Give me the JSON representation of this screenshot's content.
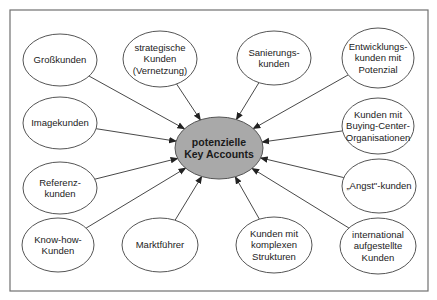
{
  "frame": {
    "x": 10,
    "y": 10,
    "width": 418,
    "height": 281,
    "stroke": "#707070"
  },
  "colors": {
    "center_fill": "#a9a9a9",
    "stroke": "#555555",
    "arrow": "#333333",
    "node_fill": "#ffffff"
  },
  "center": {
    "id": "potenzielle-key-accounts",
    "lines": [
      "potenzielle",
      "Key Accounts"
    ],
    "cx": 219,
    "cy": 148,
    "rx": 44,
    "ry": 31
  },
  "nodes": [
    {
      "id": "grosskunden",
      "lines": [
        "Großkunden"
      ],
      "cx": 60,
      "cy": 60,
      "rx": 37,
      "ry": 26
    },
    {
      "id": "strategische-kunden",
      "lines": [
        "strategische",
        "Kunden",
        "(Vernetzung)"
      ],
      "cx": 160,
      "cy": 59,
      "rx": 37,
      "ry": 28
    },
    {
      "id": "sanierungskunden",
      "lines": [
        "Sanierungs-",
        "kunden"
      ],
      "cx": 274,
      "cy": 58,
      "rx": 37,
      "ry": 27
    },
    {
      "id": "entwicklungskunden",
      "lines": [
        "Entwicklungs-",
        "kunden mit",
        "Potenzial"
      ],
      "cx": 378,
      "cy": 58,
      "rx": 36,
      "ry": 30
    },
    {
      "id": "imagekunden",
      "lines": [
        "Imagekunden"
      ],
      "cx": 60,
      "cy": 123,
      "rx": 37,
      "ry": 26
    },
    {
      "id": "buying-center-kunden",
      "lines": [
        "Kunden mit",
        "Buying-Center-",
        "Organisationen"
      ],
      "cx": 378,
      "cy": 126,
      "rx": 36,
      "ry": 28
    },
    {
      "id": "referenzkunden",
      "lines": [
        "Referenz-",
        "kunden"
      ],
      "cx": 60,
      "cy": 188,
      "rx": 37,
      "ry": 26
    },
    {
      "id": "angst-kunden",
      "lines": [
        "„Angst\"-kunden"
      ],
      "cx": 379,
      "cy": 186,
      "rx": 37,
      "ry": 27
    },
    {
      "id": "know-how-kunden",
      "lines": [
        "Know-how-",
        "Kunden"
      ],
      "cx": 58,
      "cy": 245,
      "rx": 36,
      "ry": 27
    },
    {
      "id": "marktfuehrer",
      "lines": [
        "Marktführer"
      ],
      "cx": 160,
      "cy": 245,
      "rx": 38,
      "ry": 27
    },
    {
      "id": "komplexe-strukturen",
      "lines": [
        "Kunden mit",
        "komplexen",
        "Strukturen"
      ],
      "cx": 274,
      "cy": 245,
      "rx": 38,
      "ry": 28
    },
    {
      "id": "international-kunden",
      "lines": [
        "international",
        "aufgestellte",
        "Kunden"
      ],
      "cx": 378,
      "cy": 246,
      "rx": 38,
      "ry": 28
    }
  ]
}
